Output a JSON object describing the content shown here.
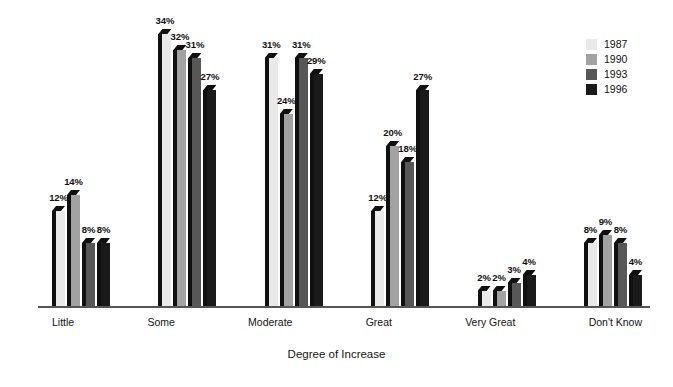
{
  "chart_data": {
    "type": "bar",
    "title": "",
    "subtitle": "",
    "xlabel": "Degree of Increase",
    "ylabel": "",
    "ylim": [
      0,
      34
    ],
    "grid": false,
    "legend_position": "top-right",
    "value_suffix": "%",
    "categories": [
      "Little",
      "Some",
      "Moderate",
      "Great",
      "Very Great",
      "Don't Know"
    ],
    "series": [
      {
        "name": "1987",
        "color": "#e9e9e9",
        "values": [
          12,
          34,
          31,
          12,
          2,
          8
        ]
      },
      {
        "name": "1990",
        "color": "#a2a2a2",
        "values": [
          14,
          32,
          24,
          20,
          2,
          9
        ]
      },
      {
        "name": "1993",
        "color": "#575757",
        "values": [
          8,
          31,
          31,
          18,
          3,
          8
        ]
      },
      {
        "name": "1996",
        "color": "#1a1a1a",
        "values": [
          8,
          27,
          29,
          27,
          4,
          4
        ]
      }
    ],
    "data_labels": [
      [
        "12%",
        "14%",
        "8%",
        "8%"
      ],
      [
        "34%",
        "32%",
        "31%",
        "27%"
      ],
      [
        "31%",
        "24%",
        "31%",
        "29%"
      ],
      [
        "12%",
        "20%",
        "18%",
        "27%"
      ],
      [
        "2%",
        "2%",
        "3%",
        "4%"
      ],
      [
        "8%",
        "9%",
        "8%",
        "4%"
      ]
    ]
  },
  "legend": {
    "items": [
      {
        "label": "1987"
      },
      {
        "label": "1990"
      },
      {
        "label": "1993"
      },
      {
        "label": "1996"
      }
    ]
  },
  "colors": {
    "axis": "#555555",
    "bar_side": "#101010",
    "text": "#141414",
    "background": "#ffffff"
  }
}
